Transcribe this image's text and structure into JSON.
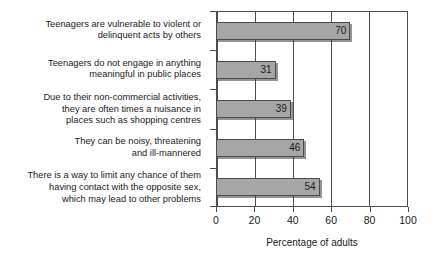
{
  "chart_data": {
    "type": "bar",
    "orientation": "horizontal",
    "title": "",
    "xlabel": "Percentage of adults",
    "ylabel": "",
    "xlim": [
      0,
      100
    ],
    "xticks": [
      0,
      20,
      40,
      60,
      80,
      100
    ],
    "xtick_labels": [
      "0",
      "20",
      "40",
      "60",
      "80",
      "100"
    ],
    "grid": "vertical",
    "legend": "none",
    "bar_color": "#a6a6a6",
    "bar_edge_color": "#4a4a4a",
    "axis_color": "#4d4d4d",
    "categories": [
      "Teenagers are vulnerable to violent or delinquent acts by others",
      "Teenagers do not engage in anything meaningful in public places",
      "Due to their non-commercial activities, they are often times a nuisance in places such as shopping centres",
      "They can be noisy, threatening and ill-mannered",
      "There is a way to limit any chance of them having contact with the opposite sex, which may lead to other problems"
    ],
    "category_lines": [
      [
        "Teenagers are vulnerable to violent or",
        "delinquent acts by others"
      ],
      [
        "Teenagers do not engage in anything",
        "meaningful in public places"
      ],
      [
        "Due to their non-commercial activities,",
        "they are often times a nuisance in",
        "places such as shopping centres"
      ],
      [
        "They can be noisy, threatening",
        "and ill-mannered"
      ],
      [
        "There is a way to limit any chance of them",
        "having contact with the opposite sex,",
        "which may lead to other problems"
      ]
    ],
    "values": [
      70,
      31,
      39,
      46,
      54
    ],
    "value_labels": [
      "70",
      "31",
      "39",
      "46",
      "54"
    ]
  }
}
